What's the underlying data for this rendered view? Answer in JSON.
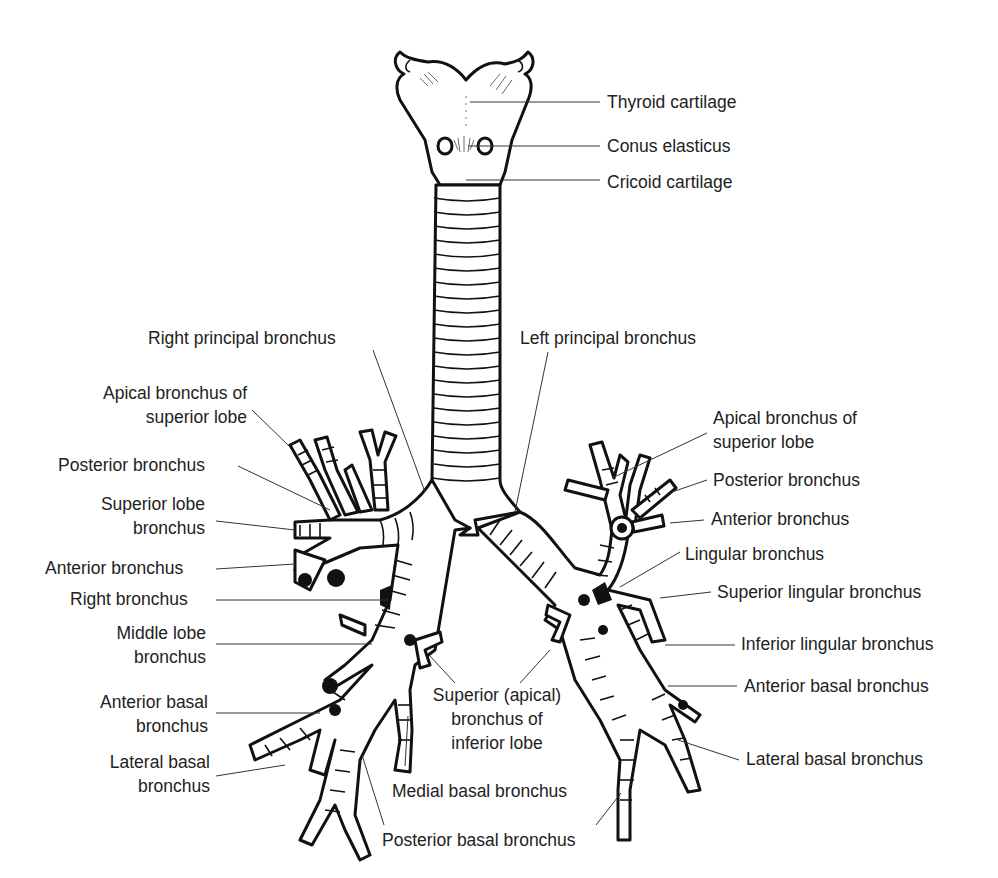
{
  "diagram": {
    "stroke_color": "#111111",
    "background": "#ffffff",
    "labels": [
      {
        "id": "thyroid-cartilage",
        "lines": [
          "Thyroid cartilage"
        ],
        "x": 607,
        "y": 90,
        "align": "left",
        "leader": [
          [
            470,
            102
          ],
          [
            600,
            102
          ]
        ]
      },
      {
        "id": "conus-elasticus",
        "lines": [
          "Conus elasticus"
        ],
        "x": 607,
        "y": 134,
        "align": "left",
        "leader": [
          [
            468,
            146
          ],
          [
            600,
            146
          ]
        ]
      },
      {
        "id": "cricoid-cartilage",
        "lines": [
          "Cricoid cartilage"
        ],
        "x": 607,
        "y": 170,
        "align": "left",
        "leader": [
          [
            466,
            180
          ],
          [
            600,
            180
          ]
        ]
      },
      {
        "id": "right-principal-bronchus",
        "lines": [
          "Right principal bronchus"
        ],
        "x": 148,
        "y": 326,
        "align": "left",
        "leader": [
          [
            373,
            350
          ],
          [
            425,
            492
          ]
        ]
      },
      {
        "id": "left-principal-bronchus",
        "lines": [
          "Left principal bronchus"
        ],
        "x": 520,
        "y": 326,
        "align": "left",
        "leader": [
          [
            548,
            352
          ],
          [
            515,
            512
          ]
        ]
      },
      {
        "id": "right-apical-bronchus-superior-lobe",
        "lines": [
          "Apical bronchus of",
          "superior lobe"
        ],
        "x": 72,
        "y": 381,
        "align": "right",
        "w": 175,
        "leader": [
          [
            252,
            410
          ],
          [
            290,
            447
          ]
        ]
      },
      {
        "id": "right-posterior-bronchus",
        "lines": [
          "Posterior bronchus"
        ],
        "x": 58,
        "y": 453,
        "align": "left",
        "leader": [
          [
            238,
            466
          ],
          [
            330,
            510
          ]
        ]
      },
      {
        "id": "superior-lobe-bronchus",
        "lines": [
          "Superior lobe",
          "bronchus"
        ],
        "x": 80,
        "y": 492,
        "align": "right",
        "w": 125,
        "leader": [
          [
            216,
            521
          ],
          [
            295,
            530
          ]
        ]
      },
      {
        "id": "right-anterior-bronchus",
        "lines": [
          "Anterior bronchus"
        ],
        "x": 45,
        "y": 556,
        "align": "left",
        "leader": [
          [
            216,
            569
          ],
          [
            295,
            564
          ]
        ]
      },
      {
        "id": "right-bronchus",
        "lines": [
          "Right bronchus"
        ],
        "x": 70,
        "y": 587,
        "align": "left",
        "leader": [
          [
            216,
            600
          ],
          [
            388,
            600
          ]
        ]
      },
      {
        "id": "middle-lobe-bronchus",
        "lines": [
          "Middle lobe",
          "bronchus"
        ],
        "x": 100,
        "y": 621,
        "align": "right",
        "w": 106,
        "leader": [
          [
            216,
            644
          ],
          [
            372,
            644
          ]
        ]
      },
      {
        "id": "superior-apical-bronchus-inferior-lobe",
        "lines": [
          "Superior (apical)",
          "bronchus of",
          "inferior lobe"
        ],
        "x": 418,
        "y": 683,
        "align": "center",
        "w": 158,
        "leaders": [
          [
            [
              430,
              656
            ],
            [
              455,
              683
            ]
          ],
          [
            [
              550,
              650
            ],
            [
              520,
              683
            ]
          ]
        ]
      },
      {
        "id": "right-anterior-basal-bronchus",
        "lines": [
          "Anterior basal",
          "bronchus"
        ],
        "x": 78,
        "y": 690,
        "align": "right",
        "w": 130,
        "leader": [
          [
            216,
            713
          ],
          [
            320,
            713
          ]
        ]
      },
      {
        "id": "right-lateral-basal-bronchus",
        "lines": [
          "Lateral basal",
          "bronchus"
        ],
        "x": 82,
        "y": 750,
        "align": "right",
        "w": 128,
        "leader": [
          [
            216,
            776
          ],
          [
            285,
            765
          ]
        ]
      },
      {
        "id": "medial-basal-bronchus",
        "lines": [
          "Medial basal bronchus"
        ],
        "x": 392,
        "y": 779,
        "align": "left",
        "leader": [
          [
            405,
            766
          ],
          [
            408,
            716
          ]
        ]
      },
      {
        "id": "posterior-basal-bronchus",
        "lines": [
          "Posterior basal bronchus"
        ],
        "x": 382,
        "y": 828,
        "align": "left",
        "leaders": [
          [
            [
              384,
              825
            ],
            [
              362,
              755
            ]
          ],
          [
            [
              596,
              825
            ],
            [
              621,
              793
            ]
          ]
        ]
      },
      {
        "id": "left-apical-bronchus-superior-lobe",
        "lines": [
          "Apical bronchus of",
          "superior lobe"
        ],
        "x": 713,
        "y": 406,
        "align": "left",
        "leader": [
          [
            707,
            433
          ],
          [
            612,
            478
          ]
        ]
      },
      {
        "id": "left-posterior-bronchus",
        "lines": [
          "Posterior bronchus"
        ],
        "x": 713,
        "y": 468,
        "align": "left",
        "leader": [
          [
            707,
            480
          ],
          [
            672,
            492
          ]
        ]
      },
      {
        "id": "left-anterior-bronchus",
        "lines": [
          "Anterior bronchus"
        ],
        "x": 711,
        "y": 507,
        "align": "left",
        "leader": [
          [
            704,
            520
          ],
          [
            670,
            523
          ]
        ]
      },
      {
        "id": "lingular-bronchus",
        "lines": [
          "Lingular bronchus"
        ],
        "x": 685,
        "y": 542,
        "align": "left",
        "leader": [
          [
            680,
            552
          ],
          [
            620,
            587
          ]
        ]
      },
      {
        "id": "superior-lingular-bronchus",
        "lines": [
          "Superior lingular bronchus"
        ],
        "x": 717,
        "y": 580,
        "align": "left",
        "leader": [
          [
            711,
            592
          ],
          [
            660,
            598
          ]
        ]
      },
      {
        "id": "inferior-lingular-bronchus",
        "lines": [
          "Inferior lingular bronchus"
        ],
        "x": 741,
        "y": 632,
        "align": "left",
        "leader": [
          [
            735,
            645
          ],
          [
            665,
            645
          ]
        ]
      },
      {
        "id": "left-anterior-basal-bronchus",
        "lines": [
          "Anterior basal bronchus"
        ],
        "x": 744,
        "y": 674,
        "align": "left",
        "leader": [
          [
            737,
            686
          ],
          [
            668,
            686
          ]
        ]
      },
      {
        "id": "left-lateral-basal-bronchus",
        "lines": [
          "Lateral basal bronchus"
        ],
        "x": 746,
        "y": 747,
        "align": "left",
        "leader": [
          [
            739,
            760
          ],
          [
            678,
            740
          ]
        ]
      }
    ]
  }
}
